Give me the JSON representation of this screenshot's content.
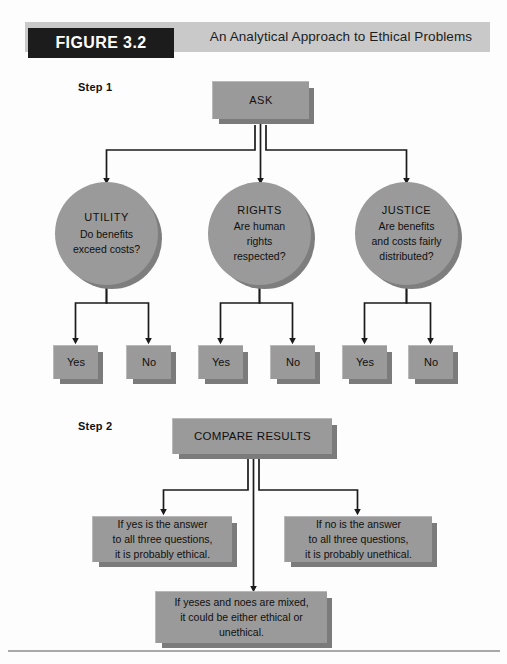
{
  "figure": {
    "tag": "FIGURE 3.2",
    "title": "An Analytical Approach to Ethical Problems"
  },
  "steps": {
    "step1_label": "Step 1",
    "step2_label": "Step 2"
  },
  "nodes": {
    "ask": "ASK",
    "compare": "COMPARE RESULTS"
  },
  "criteria": [
    {
      "title": "UTILITY",
      "line1": "Do benefits",
      "line2": "exceed costs?",
      "line3": ""
    },
    {
      "title": "RIGHTS",
      "line1": "Are human",
      "line2": "rights",
      "line3": "respected?"
    },
    {
      "title": "JUSTICE",
      "line1": "Are benefits",
      "line2": "and costs fairly",
      "line3": "distributed?"
    }
  ],
  "answers": [
    {
      "label": "Yes"
    },
    {
      "label": "No"
    },
    {
      "label": "Yes"
    },
    {
      "label": "No"
    },
    {
      "label": "Yes"
    },
    {
      "label": "No"
    }
  ],
  "results": {
    "left": {
      "line1": "If yes is the answer",
      "line2": "to all three questions,",
      "line3": "it is probably ethical."
    },
    "right": {
      "line1": "If no is the answer",
      "line2": "to all three questions,",
      "line3": "it is probably unethical."
    },
    "middle": {
      "line1": "If yeses and noes are mixed,",
      "line2": "it could be either ethical or",
      "line3": "unethical."
    }
  },
  "colors": {
    "node_fill": "#9a9a9a",
    "node_shadow": "#7b7b7b",
    "header_band": "#c9c9c9",
    "tag_bg": "#1c1c1c",
    "connector": "#1a1a1a"
  }
}
